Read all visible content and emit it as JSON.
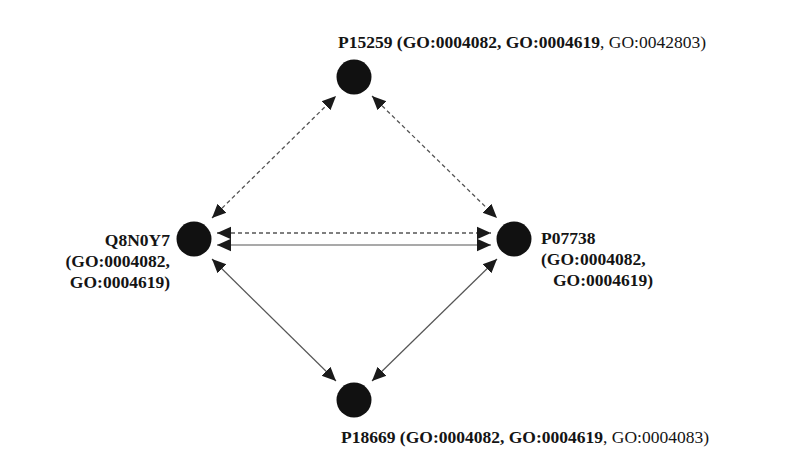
{
  "diagram": {
    "type": "protein-interaction-network",
    "colors": {
      "node": "#111111",
      "edge": "#555555",
      "arrowhead": "#1a1a1a",
      "text": "#141414",
      "background": "#ffffff"
    },
    "nodes": [
      {
        "id": "P15259",
        "x": 354,
        "y": 77,
        "r": 17.5,
        "label": {
          "name": "P15259",
          "bold_terms": [
            "GO:0004082",
            "GO:0004619"
          ],
          "normal_terms": [
            "GO:0042803"
          ],
          "text": "P15259 (GO:0004082, GO:0004619, GO:0042803)"
        }
      },
      {
        "id": "Q8N0Y7",
        "x": 194,
        "y": 239,
        "r": 17.5,
        "label": {
          "name": "Q8N0Y7",
          "bold_terms": [
            "GO:0004082",
            "GO:0004619"
          ],
          "normal_terms": [],
          "lines": [
            "Q8N0Y7",
            "(GO:0004082,",
            "GO:0004619)"
          ]
        }
      },
      {
        "id": "P07738",
        "x": 514,
        "y": 239,
        "r": 17.5,
        "label": {
          "name": "P07738",
          "bold_terms": [
            "GO:0004082",
            "GO:0004619"
          ],
          "normal_terms": [],
          "lines": [
            "P07738",
            "(GO:0004082,",
            "GO:0004619)"
          ]
        }
      },
      {
        "id": "P18669",
        "x": 354,
        "y": 400,
        "r": 17.5,
        "label": {
          "name": "P18669",
          "bold_terms": [
            "GO:0004082",
            "GO:0004619"
          ],
          "normal_terms": [
            "GO:0004083"
          ],
          "text": "P18669 (GO:0004082, GO:0004619, GO:0004083)"
        }
      }
    ],
    "edges": [
      {
        "from": "Q8N0Y7",
        "to": "P15259",
        "style": "dashed",
        "bidirectional": true,
        "x1": 212,
        "y1": 218,
        "x2": 336,
        "y2": 96
      },
      {
        "from": "P15259",
        "to": "P07738",
        "style": "dashed",
        "bidirectional": true,
        "x1": 372,
        "y1": 96,
        "x2": 497,
        "y2": 218
      },
      {
        "from": "Q8N0Y7",
        "to": "P07738",
        "style": "dashed",
        "bidirectional": true,
        "x1": 217,
        "y1": 233,
        "x2": 491,
        "y2": 233
      },
      {
        "from": "Q8N0Y7",
        "to": "P07738",
        "style": "solid",
        "bidirectional": true,
        "x1": 217,
        "y1": 245,
        "x2": 491,
        "y2": 245
      },
      {
        "from": "Q8N0Y7",
        "to": "P18669",
        "style": "solid",
        "bidirectional": true,
        "x1": 212,
        "y1": 259,
        "x2": 336,
        "y2": 381
      },
      {
        "from": "P07738",
        "to": "P18669",
        "style": "solid",
        "bidirectional": true,
        "x1": 497,
        "y1": 259,
        "x2": 372,
        "y2": 381
      }
    ]
  },
  "labels": {
    "top": {
      "name": "P15259",
      "open": " (",
      "bold1": "GO:0004082",
      "sep1": ", ",
      "bold2": "GO:0004619",
      "sep2": ", ",
      "normal1": "GO:0042803",
      "close": ")"
    },
    "left": {
      "line1": "Q8N0Y7",
      "line2": "(GO:0004082,",
      "line3": "GO:0004619)"
    },
    "right": {
      "line1": "P07738",
      "line2": "(GO:0004082,",
      "line3": "GO:0004619)"
    },
    "bottom": {
      "name": "P18669",
      "open": " (",
      "bold1": "GO:0004082",
      "sep1": ", ",
      "bold2": "GO:0004619",
      "sep2": ", ",
      "normal1": "GO:0004083",
      "close": ")"
    }
  }
}
